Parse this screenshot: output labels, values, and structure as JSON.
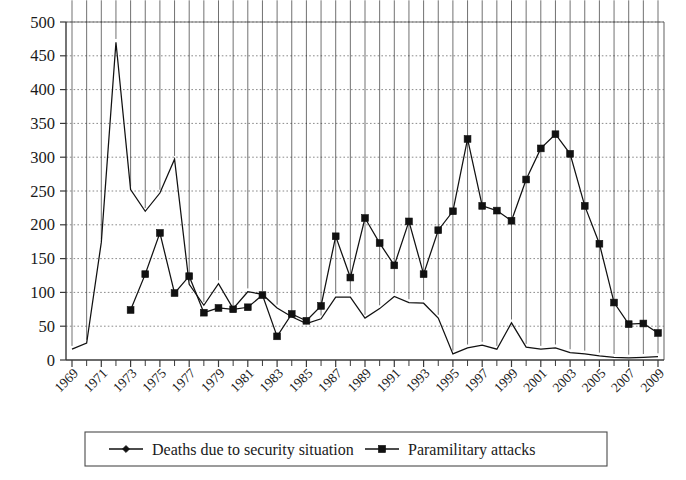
{
  "chart_data": {
    "type": "line",
    "title": "",
    "subtitle": "",
    "xlabel": "",
    "ylabel": "",
    "grid": "horizontal-dotted",
    "legend_position": "bottom",
    "ylim": [
      0,
      500
    ],
    "ytick_step": 50,
    "ytick_labels": [
      "0",
      "50",
      "100",
      "150",
      "200",
      "250",
      "300",
      "350",
      "400",
      "450",
      "500"
    ],
    "x": [
      1969,
      1970,
      1971,
      1972,
      1973,
      1974,
      1975,
      1976,
      1977,
      1978,
      1979,
      1980,
      1981,
      1982,
      1983,
      1984,
      1985,
      1986,
      1987,
      1988,
      1989,
      1990,
      1991,
      1992,
      1993,
      1994,
      1995,
      1996,
      1997,
      1998,
      1999,
      2000,
      2001,
      2002,
      2003,
      2004,
      2005,
      2006,
      2007,
      2008,
      2009
    ],
    "xtick_labels": [
      "1969",
      "1971",
      "1973",
      "1975",
      "1977",
      "1979",
      "1981",
      "1983",
      "1985",
      "1987",
      "1989",
      "1991",
      "1993",
      "1995",
      "1997",
      "1999",
      "2001",
      "2003",
      "2005",
      "2007",
      "2009"
    ],
    "xtick_label_years": [
      1969,
      1971,
      1973,
      1975,
      1977,
      1979,
      1981,
      1983,
      1985,
      1987,
      1989,
      1991,
      1993,
      1995,
      1997,
      1999,
      2001,
      2003,
      2005,
      2007,
      2009
    ],
    "xtick_label_rotation": 45,
    "series": [
      {
        "name": "Deaths due to security situation",
        "marker": "diamond",
        "color": "#111111",
        "x": [
          1969,
          1970,
          1971,
          1972,
          1973,
          1974,
          1975,
          1976,
          1977,
          1978,
          1979,
          1980,
          1981,
          1982,
          1983,
          1984,
          1985,
          1986,
          1987,
          1988,
          1989,
          1990,
          1991,
          1992,
          1993,
          1994,
          1995,
          1996,
          1997,
          1998,
          1999,
          2000,
          2001,
          2002,
          2003,
          2004,
          2005,
          2006,
          2007,
          2008,
          2009
        ],
        "values": [
          16,
          25,
          174,
          470,
          252,
          220,
          247,
          297,
          112,
          81,
          113,
          76,
          101,
          97,
          77,
          64,
          54,
          61,
          93,
          93,
          62,
          76,
          94,
          85,
          84,
          62,
          9,
          18,
          22,
          16,
          55,
          19,
          16,
          18,
          11,
          9,
          6,
          4,
          3,
          4,
          5
        ]
      },
      {
        "name": "Paramilitary attacks",
        "marker": "square",
        "color": "#111111",
        "x": [
          1973,
          1974,
          1975,
          1976,
          1977,
          1978,
          1979,
          1980,
          1981,
          1982,
          1983,
          1984,
          1985,
          1986,
          1987,
          1988,
          1989,
          1990,
          1991,
          1992,
          1993,
          1994,
          1995,
          1996,
          1997,
          1998,
          1999,
          2000,
          2001,
          2002,
          2003,
          2004,
          2005,
          2006,
          2007,
          2008,
          2009
        ],
        "values": [
          74,
          127,
          188,
          99,
          124,
          70,
          77,
          75,
          78,
          96,
          35,
          68,
          58,
          80,
          183,
          122,
          210,
          173,
          140,
          205,
          127,
          192,
          220,
          327,
          228,
          221,
          206,
          267,
          313,
          334,
          305,
          228,
          172,
          85,
          53,
          54,
          40
        ]
      }
    ]
  },
  "legend": {
    "items": [
      {
        "label": "Deaths due to security situation",
        "marker": "diamond"
      },
      {
        "label": "Paramilitary attacks",
        "marker": "square"
      }
    ]
  }
}
